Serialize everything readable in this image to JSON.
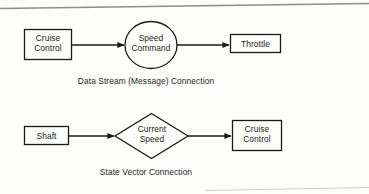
{
  "figure": {
    "background_color": "#fdfdfc",
    "line_color": "#1a1a1a",
    "text_color": "#1d1d1d"
  },
  "diagrams": [
    {
      "id": "data-stream-connection",
      "caption": "Data Stream (Message) Connection",
      "nodes": [
        {
          "id": "cruise-control-source",
          "shape": "rectangle",
          "label": "Cruise\nControl"
        },
        {
          "id": "speed-command",
          "shape": "ellipse",
          "label": "Speed\nCommand"
        },
        {
          "id": "throttle",
          "shape": "rectangle",
          "label": "Throttle"
        }
      ],
      "edges": [
        {
          "from": "cruise-control-source",
          "to": "speed-command",
          "style": "solid-arrow"
        },
        {
          "from": "speed-command",
          "to": "throttle",
          "style": "solid-arrow"
        }
      ]
    },
    {
      "id": "state-vector-connection",
      "caption": "State Vector Connection",
      "nodes": [
        {
          "id": "shaft",
          "shape": "rectangle",
          "label": "Shaft"
        },
        {
          "id": "current-speed",
          "shape": "diamond",
          "label": "Current\nSpeed"
        },
        {
          "id": "cruise-control-target",
          "shape": "rectangle",
          "label": "Cruise\nControl"
        }
      ],
      "edges": [
        {
          "from": "shaft",
          "to": "current-speed",
          "style": "solid-arrow"
        },
        {
          "from": "current-speed",
          "to": "cruise-control-target",
          "style": "solid-arrow"
        }
      ]
    }
  ],
  "labels": {
    "cruise_control_top": "Cruise\nControl",
    "speed_command": "Speed\nCommand",
    "throttle": "Throttle",
    "shaft": "Shaft",
    "current_speed": "Current\nSpeed",
    "cruise_control_bottom": "Cruise\nControl",
    "caption_top": "Data Stream (Message) Connection",
    "caption_bottom": "State Vector Connection"
  }
}
